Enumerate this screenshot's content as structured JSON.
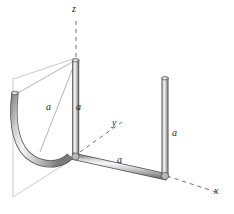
{
  "figure": {
    "kind": "engineering-diagram",
    "background_color": "#ffffff",
    "rod_color_light": "#f2f2f2",
    "rod_color_mid": "#c9c9c9",
    "rod_color_dark": "#8a8a8a",
    "rod_outline_color": "#4d4d4d",
    "plane_outline_color": "#b8b8b8",
    "construction_line_color": "#9a9a9a",
    "axis_line_color": "#6e6e6e",
    "text_color": "#1a1a1a"
  },
  "axes": [
    {
      "id": "z",
      "label": "z"
    },
    {
      "id": "y",
      "label": "y"
    },
    {
      "id": "x",
      "label": "x"
    }
  ],
  "dimensions": [
    {
      "id": "a-diagonal",
      "label": "a"
    },
    {
      "id": "a-vertical",
      "label": "a"
    },
    {
      "id": "a-bottom",
      "label": "a"
    },
    {
      "id": "a-right",
      "label": "a"
    }
  ]
}
